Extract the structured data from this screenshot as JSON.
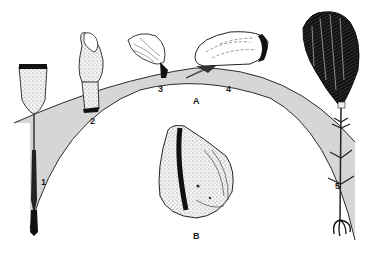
{
  "figure": {
    "labels": {
      "organism_1": "1",
      "organism_2": "2",
      "organism_3": "3",
      "organism_4": "4",
      "organism_5": "5",
      "panel_a": "A",
      "panel_b": "B"
    },
    "colors": {
      "background": "#ffffff",
      "band_fill": "#d6d6d6",
      "ink": "#1a1a1a",
      "speckle": "#8a8a8a"
    }
  }
}
